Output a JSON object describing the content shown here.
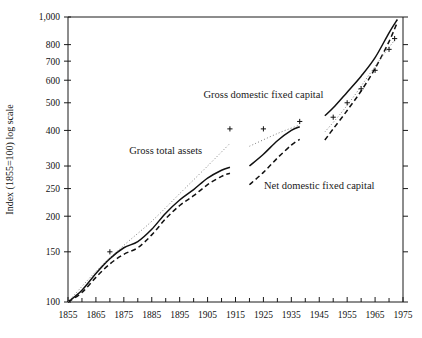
{
  "chart_data": {
    "type": "line",
    "title": "",
    "xlabel": "",
    "ylabel": "Index (1855=100) log scale",
    "yscale": "log",
    "ylim": [
      100,
      1000
    ],
    "xlim": [
      1855,
      1975
    ],
    "grid": false,
    "legend_position": "inline-annotations",
    "ytick_labels": [
      "100",
      "150",
      "200",
      "250",
      "300",
      "400",
      "500",
      "600",
      "700",
      "800",
      "1,000"
    ],
    "ytick_values": [
      100,
      150,
      200,
      250,
      300,
      400,
      500,
      600,
      700,
      800,
      1000
    ],
    "xtick_labels": [
      "1855",
      "1865",
      "1875",
      "1885",
      "1895",
      "1905",
      "1915",
      "1925",
      "1935",
      "1945",
      "1955",
      "1965",
      "1975"
    ],
    "xtick_values": [
      1855,
      1865,
      1875,
      1885,
      1895,
      1905,
      1915,
      1925,
      1935,
      1945,
      1955,
      1965,
      1975
    ],
    "xminor_values": [
      1860,
      1870,
      1880,
      1890,
      1900,
      1910,
      1920,
      1930,
      1940,
      1950,
      1960,
      1970
    ],
    "annotations": [
      {
        "text": "Gross total assets",
        "x": 1890,
        "y": 330
      },
      {
        "text": "Gross domestic fixed capital",
        "x": 1925,
        "y": 520
      },
      {
        "text": "Net domestic fixed capital",
        "x": 1945,
        "y": 250
      }
    ],
    "series": [
      {
        "name": "Gross total assets",
        "style": "solid",
        "segments": [
          {
            "x": [
              1855,
              1860,
              1865,
              1870,
              1875,
              1880,
              1885,
              1890,
              1895,
              1900,
              1905,
              1910,
              1913
            ],
            "y": [
              100,
              110,
              126,
              142,
              155,
              163,
              180,
              205,
              228,
              248,
              272,
              290,
              297
            ]
          },
          {
            "x": [
              1920,
              1925,
              1930,
              1935,
              1938
            ],
            "y": [
              300,
              330,
              368,
              400,
              412
            ]
          },
          {
            "x": [
              1947,
              1950,
              1955,
              1960,
              1965,
              1970,
              1973
            ],
            "y": [
              450,
              480,
              545,
              620,
              720,
              880,
              980
            ]
          }
        ]
      },
      {
        "name": "Net domestic fixed capital",
        "style": "dashed",
        "segments": [
          {
            "x": [
              1855,
              1860,
              1865,
              1870,
              1875,
              1880,
              1885,
              1890,
              1895,
              1900,
              1905,
              1910,
              1913
            ],
            "y": [
              100,
              108,
              122,
              136,
              147,
              155,
              172,
              196,
              218,
              236,
              258,
              276,
              283
            ]
          },
          {
            "x": [
              1920,
              1925,
              1930,
              1935,
              1938
            ],
            "y": [
              258,
              285,
              320,
              355,
              372
            ]
          },
          {
            "x": [
              1947,
              1950,
              1955,
              1960,
              1965,
              1970,
              1973
            ],
            "y": [
              370,
              405,
              470,
              550,
              660,
              820,
              960
            ]
          }
        ]
      },
      {
        "name": "Gross domestic fixed capital",
        "style": "dotted-plus",
        "segments": [
          {
            "x": [
              1855,
              1865,
              1875,
              1885,
              1895,
              1905,
              1913
            ],
            "y": [
              100,
              128,
              158,
              192,
              240,
              300,
              360
            ]
          },
          {
            "x": [
              1920,
              1930,
              1938
            ],
            "y": [
              352,
              390,
              418
            ]
          },
          {
            "x": [
              1947,
              1952,
              1957,
              1962,
              1967,
              1972
            ],
            "y": [
              395,
              450,
              520,
              610,
              715,
              830
            ]
          }
        ],
        "markers": [
          {
            "x": 1870,
            "y": 150
          },
          {
            "x": 1913,
            "y": 405
          },
          {
            "x": 1925,
            "y": 405
          },
          {
            "x": 1938,
            "y": 430
          },
          {
            "x": 1950,
            "y": 445
          },
          {
            "x": 1955,
            "y": 500
          },
          {
            "x": 1960,
            "y": 560
          },
          {
            "x": 1965,
            "y": 650
          },
          {
            "x": 1970,
            "y": 770
          },
          {
            "x": 1972,
            "y": 840
          }
        ]
      }
    ]
  }
}
